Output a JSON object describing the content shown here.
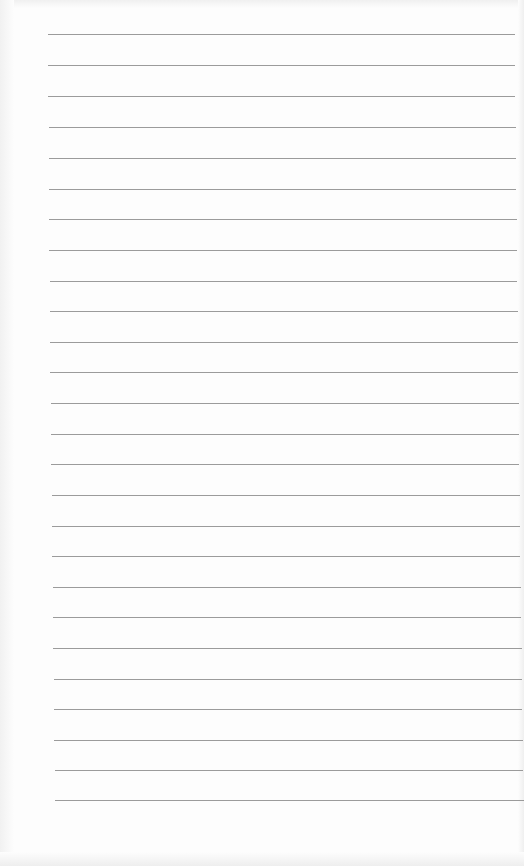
{
  "document": {
    "type": "blank lined paper",
    "background_color": "#fdfdfd",
    "rule_color": "#8a8a8a",
    "rule_count": 26,
    "rules": [
      {
        "y": 34,
        "x1": 48,
        "x2": 515
      },
      {
        "y": 65,
        "x1": 48,
        "x2": 515
      },
      {
        "y": 96,
        "x1": 48,
        "x2": 515
      },
      {
        "y": 127,
        "x1": 49,
        "x2": 516
      },
      {
        "y": 158,
        "x1": 49,
        "x2": 516
      },
      {
        "y": 189,
        "x1": 49,
        "x2": 516
      },
      {
        "y": 219,
        "x1": 49,
        "x2": 517
      },
      {
        "y": 250,
        "x1": 49,
        "x2": 517
      },
      {
        "y": 281,
        "x1": 50,
        "x2": 517
      },
      {
        "y": 311,
        "x1": 50,
        "x2": 518
      },
      {
        "y": 342,
        "x1": 50,
        "x2": 518
      },
      {
        "y": 372,
        "x1": 50,
        "x2": 518
      },
      {
        "y": 403,
        "x1": 51,
        "x2": 519
      },
      {
        "y": 434,
        "x1": 51,
        "x2": 519
      },
      {
        "y": 464,
        "x1": 51,
        "x2": 519
      },
      {
        "y": 495,
        "x1": 52,
        "x2": 520
      },
      {
        "y": 526,
        "x1": 52,
        "x2": 520
      },
      {
        "y": 556,
        "x1": 52,
        "x2": 520
      },
      {
        "y": 587,
        "x1": 53,
        "x2": 521
      },
      {
        "y": 617,
        "x1": 53,
        "x2": 521
      },
      {
        "y": 648,
        "x1": 53,
        "x2": 522
      },
      {
        "y": 679,
        "x1": 54,
        "x2": 522
      },
      {
        "y": 709,
        "x1": 54,
        "x2": 522
      },
      {
        "y": 740,
        "x1": 54,
        "x2": 523
      },
      {
        "y": 770,
        "x1": 55,
        "x2": 523
      },
      {
        "y": 800,
        "x1": 55,
        "x2": 524
      }
    ]
  }
}
